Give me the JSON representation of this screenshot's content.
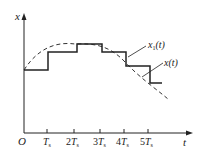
{
  "diagram": {
    "type": "sampling-reconstruction-staircase",
    "axes": {
      "y_label": "x",
      "x_label": "t",
      "origin_label": "O"
    },
    "x_ticks": [
      {
        "coef": "",
        "base": "T",
        "sub": "s"
      },
      {
        "coef": "2",
        "base": "T",
        "sub": "s"
      },
      {
        "coef": "3",
        "base": "T",
        "sub": "s"
      },
      {
        "coef": "4",
        "base": "T",
        "sub": "s"
      },
      {
        "coef": "5",
        "base": "T",
        "sub": "s"
      }
    ],
    "curves": [
      {
        "name": "x1(t)",
        "label_main": "x",
        "label_sub": "1",
        "label_arg": "(t)",
        "style": "solid-staircase",
        "color": "#222222"
      },
      {
        "name": "x(t)",
        "label_main": "x",
        "label_sub": "",
        "label_arg": "(t)",
        "style": "dashed",
        "color": "#222222"
      }
    ]
  }
}
